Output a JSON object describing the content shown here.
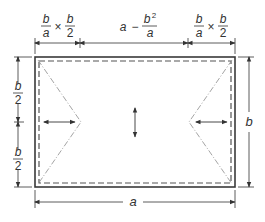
{
  "diagram": {
    "type": "rectangular-plate-yield-line",
    "colors": {
      "outline": "#3a3a3a",
      "dashed": "#555555",
      "yield_line": "#9a9a9a",
      "dimension": "#333333",
      "background": "#ffffff"
    },
    "labels": {
      "top_left": {
        "frac1_num": "b",
        "frac1_den": "a",
        "times": "×",
        "frac2_num": "b",
        "frac2_den": "2"
      },
      "top_middle": {
        "lhs": "a",
        "minus": "−",
        "frac_num": "b",
        "frac_sup": "2",
        "frac_den": "a"
      },
      "top_right": {
        "frac1_num": "b",
        "frac1_den": "a",
        "times": "×",
        "frac2_num": "b",
        "frac2_den": "2"
      },
      "left_upper": {
        "num": "b",
        "den": "2"
      },
      "left_lower": {
        "num": "b",
        "den": "2"
      },
      "right": "b",
      "bottom": "a"
    },
    "elements": [
      "outer-rectangle",
      "inner-dashed-rectangle",
      "left-triangle-yield-lines",
      "right-triangle-yield-lines",
      "left-horizontal-double-arrow",
      "right-horizontal-double-arrow",
      "center-vertical-double-arrow"
    ]
  }
}
